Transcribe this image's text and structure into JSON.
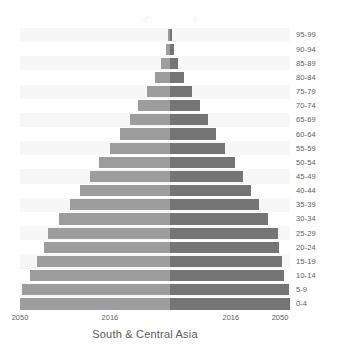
{
  "chart_data": {
    "type": "bar",
    "subtype": "population-pyramid",
    "title": "South & Central Asia",
    "xlabel": "",
    "ylabel": "",
    "grid": false,
    "legend_position": "top",
    "axis_center_value": 0,
    "categories": [
      "0-4",
      "5-9",
      "10-14",
      "15-19",
      "20-24",
      "25-29",
      "30-34",
      "35-39",
      "40-44",
      "45-49",
      "50-54",
      "55-59",
      "60-64",
      "65-69",
      "70-74",
      "75-79",
      "80-84",
      "85-89",
      "90-94",
      "95-99"
    ],
    "xtick_labels": [
      "2050",
      "2016",
      "2016",
      "2050"
    ],
    "xtick_positions_pct": [
      0,
      33.3,
      78.1,
      96.3
    ],
    "xlim_pct": [
      -100,
      100
    ],
    "series": [
      {
        "name": "Male",
        "side": "left",
        "color": "#9d9d9d",
        "values": [
          100.0,
          98.6,
          93.3,
          88.7,
          84.1,
          81.2,
          74.0,
          66.9,
          60.3,
          53.4,
          47.1,
          39.8,
          33.6,
          27.0,
          21.5,
          15.6,
          10.2,
          6.2,
          3.0,
          1.5
        ]
      },
      {
        "name": "Female",
        "side": "right",
        "color": "#757575",
        "values": [
          100.0,
          99.1,
          95.2,
          93.6,
          91.1,
          89.6,
          81.3,
          73.9,
          67.3,
          60.5,
          53.9,
          46.1,
          38.7,
          31.5,
          24.8,
          18.2,
          11.9,
          7.0,
          3.4,
          1.6
        ]
      }
    ],
    "legend": [
      {
        "label": "Male",
        "symbol": "♂",
        "color": "#f0f0f0"
      },
      {
        "label": "Female",
        "symbol": "♀",
        "color": "#f0f0f0"
      }
    ]
  },
  "colors": {
    "male_bar": "#9d9d9d",
    "female_bar": "#757575",
    "stripe": "#f7f7f7",
    "text": "#5e5e5e",
    "background": "#ffffff"
  }
}
